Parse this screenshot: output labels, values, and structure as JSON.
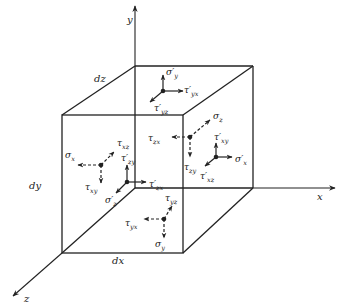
{
  "diagram": {
    "type": "stress-element-cube",
    "axes": {
      "x": "x",
      "y": "y",
      "z": "z"
    },
    "dimensions": {
      "dx": "dx",
      "dy": "dy",
      "dz": "dz"
    },
    "stress_labels": {
      "top_face": {
        "sigma_y_prime": "σ′",
        "sigma_y_prime_sub": "y",
        "tau_yx_prime": "τ′",
        "tau_yx_prime_sub": "yx",
        "tau_yz_prime": "τ′",
        "tau_yz_prime_sub": "yz"
      },
      "back_face": {
        "sigma_z": "σ",
        "sigma_z_sub": "z",
        "tau_zx": "τ",
        "tau_zx_sub": "zx",
        "tau_zy": "τ",
        "tau_zy_sub": "zy"
      },
      "right_face": {
        "tau_xy_prime": "τ′",
        "tau_xy_prime_sub": "xy",
        "sigma_x_prime": "σ′",
        "sigma_x_prime_sub": "x",
        "tau_xz_prime": "τ′",
        "tau_xz_prime_sub": "xz"
      },
      "left_face": {
        "sigma_x": "σ",
        "sigma_x_sub": "x",
        "tau_xz": "τ",
        "tau_xz_sub": "xz",
        "tau_xy": "τ",
        "tau_xy_sub": "xy"
      },
      "front_face": {
        "tau_zy_prime": "τ′",
        "tau_zy_prime_sub": "zy",
        "tau_zx_prime": "τ′",
        "tau_zx_prime_sub": "zx",
        "sigma_z_prime": "σ′",
        "sigma_z_prime_sub": "z"
      },
      "bottom_face": {
        "tau_yz": "τ",
        "tau_yz_sub": "yz",
        "tau_yx": "τ",
        "tau_yx_sub": "yx",
        "sigma_y": "σ",
        "sigma_y_sub": "y"
      }
    }
  }
}
